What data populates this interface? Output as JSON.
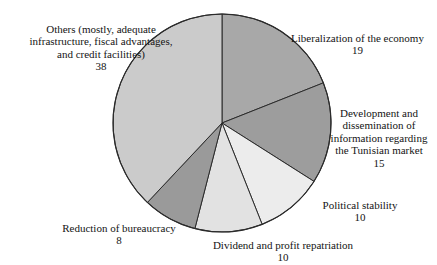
{
  "chart_data": {
    "type": "pie",
    "title": "",
    "subtitle": "",
    "xlabel": "",
    "ylabel": "",
    "grid": false,
    "legend_position": "none",
    "total": 100,
    "start_angle_deg": 0,
    "direction": "clockwise",
    "categories": [
      "Liberalization of the economy",
      "Development and dissemination of information regarding the Tunisian market",
      "Political stability",
      "Dividend and profit repatriation",
      "Reduction of bureaucracy",
      "Others (mostly, adequate infrastructure, fiscal advantages, and credit facilities)"
    ],
    "values": [
      19,
      15,
      10,
      10,
      8,
      38
    ],
    "slices": [
      {
        "key": "liberalization",
        "label": "Liberalization of the economy",
        "value": "19",
        "value_num": 19,
        "color": "#a8a8a8",
        "start_deg": 0,
        "end_deg": 68.4
      },
      {
        "key": "development",
        "label": "Development and\ndissemination of\ninformation regarding\nthe Tunisian market",
        "value": "15",
        "value_num": 15,
        "color": "#9d9d9d",
        "start_deg": 68.4,
        "end_deg": 122.4
      },
      {
        "key": "political-stability",
        "label": "Political stability",
        "value": "10",
        "value_num": 10,
        "color": "#ececec",
        "start_deg": 122.4,
        "end_deg": 158.4
      },
      {
        "key": "dividend",
        "label": "Dividend and profit repatriation",
        "value": "10",
        "value_num": 10,
        "color": "#e2e2e2",
        "start_deg": 158.4,
        "end_deg": 194.4
      },
      {
        "key": "reduction-bureaucracy",
        "label": "Reduction of bureaucracy",
        "value": "8",
        "value_num": 8,
        "color": "#9a9a9a",
        "start_deg": 194.4,
        "end_deg": 223.2
      },
      {
        "key": "others",
        "label": "Others (mostly, adequate\ninfrastructure, fiscal advantages,\nand credit facilities)",
        "value": "38",
        "value_num": 38,
        "color": "#cbcbcb",
        "start_deg": 223.2,
        "end_deg": 360
      }
    ],
    "geometry": {
      "cx": 222,
      "cy": 123,
      "r": 109
    },
    "style": {
      "background": "#ffffff",
      "outline": "#2b2b2b",
      "text": "#141414"
    }
  }
}
